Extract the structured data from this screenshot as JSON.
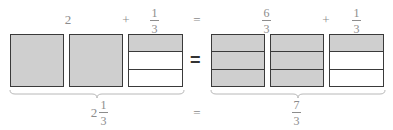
{
  "top_row": {
    "left_whole": "2",
    "plus_1": "+",
    "left_frac": {
      "num": "1",
      "den": "3"
    },
    "equals": "=",
    "right_frac1": {
      "num": "6",
      "den": "3"
    },
    "plus_2": "+",
    "right_frac2": {
      "num": "1",
      "den": "3"
    }
  },
  "middle_equals": "=",
  "bottom_row": {
    "mixed_whole": "2",
    "mixed_frac": {
      "num": "1",
      "den": "3"
    },
    "equals": "=",
    "result_frac": {
      "num": "7",
      "den": "3"
    }
  },
  "colors": {
    "shaded": "#cfcfcf",
    "border": "#3a3a3a",
    "text": "#8c8c8c"
  }
}
